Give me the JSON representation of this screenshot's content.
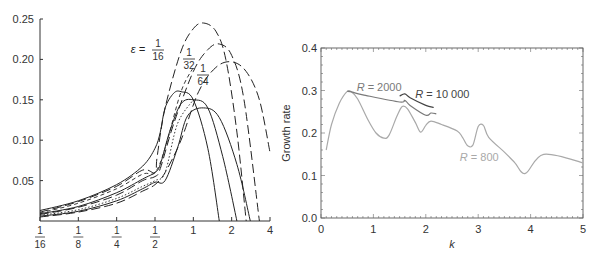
{
  "chart_data": [
    {
      "type": "line",
      "title": "",
      "xlabel": "",
      "ylabel": "",
      "xscale": "log2",
      "x_tick_labels": [
        {
          "num": "1",
          "den": "16",
          "value": 0.0625
        },
        {
          "num": "1",
          "den": "8",
          "value": 0.125
        },
        {
          "num": "1",
          "den": "4",
          "value": 0.25
        },
        {
          "num": "1",
          "den": "2",
          "value": 0.5
        },
        {
          "num": "",
          "den": "",
          "label": "1",
          "value": 1
        },
        {
          "num": "",
          "den": "",
          "label": "2",
          "value": 2
        },
        {
          "num": "",
          "den": "",
          "label": "4",
          "value": 4
        }
      ],
      "y_tick_labels": [
        "0.05",
        "0.10",
        "0.15",
        "0.20",
        "0.25"
      ],
      "y_ticks": [
        0.05,
        0.1,
        0.15,
        0.2,
        0.25
      ],
      "xlim": [
        0.0625,
        4
      ],
      "ylim": [
        0,
        0.25
      ],
      "grid": false,
      "annotations": [
        {
          "text_prefix": "ε =",
          "num": "1",
          "den": "16"
        },
        {
          "text_prefix": "",
          "num": "1",
          "den": "32"
        },
        {
          "text_prefix": "",
          "num": "1",
          "den": "64"
        }
      ],
      "series": [
        {
          "name": "ε=1/16 solid",
          "style": "solid",
          "x": [
            0.0625,
            0.125,
            0.25,
            0.4,
            0.5,
            0.55,
            0.6,
            0.7,
            0.8,
            1.0,
            1.3,
            1.6
          ],
          "y": [
            0.013,
            0.025,
            0.045,
            0.068,
            0.09,
            0.11,
            0.14,
            0.158,
            0.16,
            0.15,
            0.09,
            0.0
          ]
        },
        {
          "name": "ε=1/32 solid",
          "style": "solid",
          "x": [
            0.0625,
            0.125,
            0.25,
            0.4,
            0.5,
            0.55,
            0.65,
            0.8,
            1.0,
            1.3,
            1.7,
            2.2
          ],
          "y": [
            0.009,
            0.018,
            0.035,
            0.052,
            0.06,
            0.07,
            0.11,
            0.145,
            0.15,
            0.14,
            0.08,
            0.0
          ]
        },
        {
          "name": "ε=1/64 solid",
          "style": "solid",
          "x": [
            0.0625,
            0.125,
            0.25,
            0.4,
            0.5,
            0.6,
            0.75,
            0.9,
            1.2,
            1.6,
            2.2,
            2.8
          ],
          "y": [
            0.006,
            0.012,
            0.025,
            0.04,
            0.048,
            0.05,
            0.09,
            0.13,
            0.14,
            0.128,
            0.07,
            0.0
          ]
        },
        {
          "name": "ε=1/16 dashed",
          "style": "long-dash",
          "x": [
            0.0625,
            0.125,
            0.25,
            0.4,
            0.5,
            0.52,
            0.6,
            0.8,
            1.0,
            1.2,
            1.5,
            1.8,
            2.2,
            2.6
          ],
          "y": [
            0.011,
            0.024,
            0.043,
            0.063,
            0.06,
            0.08,
            0.14,
            0.21,
            0.238,
            0.245,
            0.235,
            0.2,
            0.11,
            0.0
          ]
        },
        {
          "name": "ε=1/32 dashed",
          "style": "long-dash",
          "x": [
            0.0625,
            0.125,
            0.25,
            0.4,
            0.5,
            0.55,
            0.7,
            1.0,
            1.3,
            1.6,
            2.0,
            2.5,
            3.3
          ],
          "y": [
            0.008,
            0.017,
            0.032,
            0.05,
            0.055,
            0.065,
            0.12,
            0.185,
            0.212,
            0.219,
            0.205,
            0.15,
            0.0
          ]
        },
        {
          "name": "ε=1/64 dashed",
          "style": "long-dash",
          "x": [
            0.0625,
            0.125,
            0.25,
            0.4,
            0.5,
            0.6,
            0.8,
            1.1,
            1.5,
            2.0,
            2.6,
            3.3,
            4.0
          ],
          "y": [
            0.005,
            0.011,
            0.022,
            0.037,
            0.045,
            0.06,
            0.1,
            0.16,
            0.19,
            0.197,
            0.185,
            0.15,
            0.085
          ]
        },
        {
          "name": "short-dash",
          "style": "short-dash",
          "x": [
            0.0625,
            0.125,
            0.25,
            0.4,
            0.5,
            0.6,
            0.8,
            1.0
          ],
          "y": [
            0.01,
            0.022,
            0.04,
            0.058,
            0.06,
            0.09,
            0.16,
            0.19
          ]
        },
        {
          "name": "dotted",
          "style": "dotted",
          "x": [
            0.0625,
            0.125,
            0.25,
            0.4,
            0.5,
            0.6,
            0.75,
            1.0
          ],
          "y": [
            0.007,
            0.014,
            0.028,
            0.043,
            0.05,
            0.06,
            0.12,
            0.15
          ]
        }
      ]
    },
    {
      "type": "line",
      "title": "",
      "xlabel": "k",
      "ylabel": "Growth rate",
      "xlim": [
        0,
        5
      ],
      "ylim": [
        0,
        0.4
      ],
      "x_ticks": [
        0,
        1,
        2,
        3,
        4,
        5
      ],
      "x_tick_labels": [
        "0",
        "1",
        "2",
        "3",
        "4",
        "5"
      ],
      "y_ticks": [
        0.0,
        0.1,
        0.2,
        0.3,
        0.4
      ],
      "y_tick_labels": [
        "0.0",
        "0.1",
        "0.2",
        "0.3",
        "0.4"
      ],
      "grid": false,
      "series": [
        {
          "name": "R = 800",
          "label_x": 2.65,
          "label_y": 0.135,
          "color": "#a9a9a9",
          "x": [
            0.1,
            0.2,
            0.35,
            0.5,
            0.58,
            0.7,
            0.9,
            1.05,
            1.2,
            1.3,
            1.45,
            1.55,
            1.65,
            1.8,
            1.9,
            2.0,
            2.1,
            2.3,
            2.6,
            2.7,
            2.8,
            2.9,
            3.0,
            3.1,
            3.2,
            3.5,
            3.7,
            3.9,
            4.25,
            5.0
          ],
          "y": [
            0.16,
            0.22,
            0.27,
            0.298,
            0.297,
            0.28,
            0.23,
            0.2,
            0.188,
            0.195,
            0.24,
            0.262,
            0.257,
            0.225,
            0.202,
            0.218,
            0.228,
            0.22,
            0.205,
            0.19,
            0.17,
            0.172,
            0.215,
            0.218,
            0.19,
            0.155,
            0.13,
            0.105,
            0.15,
            0.13
          ]
        },
        {
          "name": "R = 2000",
          "label_x": 0.68,
          "label_y": 0.3,
          "color": "#7a7a7a",
          "x": [
            0.5,
            0.6,
            0.8,
            1.5,
            1.6,
            1.7,
            2.0,
            2.1,
            2.2
          ],
          "y": [
            0.298,
            0.296,
            0.29,
            0.273,
            0.277,
            0.265,
            0.242,
            0.247,
            0.245
          ]
        },
        {
          "name": "R = 10 000",
          "label_x": 1.8,
          "label_y": 0.283,
          "color": "#444444",
          "x": [
            1.5,
            1.6,
            1.7,
            2.0,
            2.15
          ],
          "y": [
            0.287,
            0.292,
            0.283,
            0.265,
            0.26
          ]
        }
      ]
    }
  ]
}
